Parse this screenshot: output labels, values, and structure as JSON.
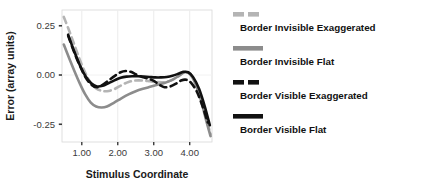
{
  "chart_data": {
    "type": "line",
    "title": "",
    "xlabel": "Stimulus Coordinate",
    "ylabel": "Error (array units)",
    "xlim": [
      0.45,
      4.62
    ],
    "ylim": [
      -0.34,
      0.33
    ],
    "xticks": [
      "1.00",
      "2.00",
      "3.00",
      "4.00"
    ],
    "xtick_values": [
      1.0,
      2.0,
      3.0,
      4.0
    ],
    "yticks": [
      "0.25",
      "0.00",
      "-0.25"
    ],
    "ytick_values": [
      0.25,
      0.0,
      -0.25
    ],
    "grid": "vertical-major-only",
    "legend_position": "right",
    "series": [
      {
        "name": "Border Invisible Exaggerated",
        "color": "#b4b4b4",
        "dash": "dashed",
        "x": [
          0.5,
          0.65,
          0.8,
          0.95,
          1.1,
          1.25,
          1.4,
          1.55,
          1.7,
          1.9,
          2.1,
          2.3,
          2.5,
          2.7,
          2.9,
          3.1,
          3.3,
          3.5,
          3.7,
          3.85,
          4.0,
          4.15,
          4.3,
          4.45,
          4.58
        ],
        "y": [
          0.295,
          0.225,
          0.15,
          0.075,
          0.01,
          -0.04,
          -0.068,
          -0.08,
          -0.082,
          -0.072,
          -0.052,
          -0.035,
          -0.028,
          -0.028,
          -0.032,
          -0.036,
          -0.036,
          -0.026,
          -0.004,
          0.012,
          0.008,
          -0.035,
          -0.11,
          -0.215,
          -0.3
        ]
      },
      {
        "name": "Border Invisible Flat",
        "color": "#8c8c8c",
        "dash": "solid",
        "x": [
          0.5,
          0.65,
          0.8,
          0.95,
          1.1,
          1.25,
          1.4,
          1.55,
          1.7,
          1.9,
          2.1,
          2.3,
          2.5,
          2.7,
          2.9,
          3.1,
          3.3,
          3.5,
          3.7,
          3.85,
          4.0,
          4.15,
          4.3,
          4.45,
          4.58
        ],
        "y": [
          0.155,
          0.085,
          0.018,
          -0.045,
          -0.1,
          -0.14,
          -0.16,
          -0.165,
          -0.16,
          -0.14,
          -0.118,
          -0.098,
          -0.082,
          -0.07,
          -0.06,
          -0.05,
          -0.04,
          -0.026,
          -0.004,
          0.014,
          0.006,
          -0.04,
          -0.12,
          -0.225,
          -0.31
        ]
      },
      {
        "name": "Border Visible Exaggerated",
        "color": "#111111",
        "dash": "dashed",
        "x": [
          0.62,
          0.78,
          0.94,
          1.1,
          1.26,
          1.42,
          1.58,
          1.74,
          1.92,
          2.08,
          2.22,
          2.36,
          2.52,
          2.68,
          2.84,
          3.0,
          3.16,
          3.3,
          3.46,
          3.62,
          3.76,
          3.9,
          4.04,
          4.2,
          4.36,
          4.5
        ],
        "y": [
          0.2,
          0.12,
          0.05,
          -0.01,
          -0.048,
          -0.062,
          -0.05,
          -0.028,
          -0.004,
          0.014,
          0.02,
          0.016,
          0.002,
          -0.01,
          -0.018,
          -0.03,
          -0.05,
          -0.062,
          -0.058,
          -0.044,
          -0.028,
          -0.024,
          -0.04,
          -0.085,
          -0.16,
          -0.24
        ]
      },
      {
        "name": "Border Visible Flat",
        "color": "#111111",
        "dash": "solid",
        "x": [
          0.62,
          0.78,
          0.94,
          1.1,
          1.26,
          1.42,
          1.58,
          1.74,
          1.92,
          2.08,
          2.24,
          2.4,
          2.56,
          2.72,
          2.88,
          3.04,
          3.2,
          3.36,
          3.52,
          3.68,
          3.82,
          3.96,
          4.1,
          4.26,
          4.42,
          4.56
        ],
        "y": [
          0.205,
          0.125,
          0.052,
          -0.005,
          -0.042,
          -0.058,
          -0.055,
          -0.042,
          -0.026,
          -0.014,
          -0.008,
          -0.006,
          -0.006,
          -0.008,
          -0.01,
          -0.012,
          -0.012,
          -0.01,
          -0.004,
          0.006,
          0.016,
          0.014,
          -0.012,
          -0.07,
          -0.16,
          -0.255
        ]
      }
    ]
  },
  "legend": {
    "entries": [
      {
        "label": "Border Invisible Exaggerated",
        "color": "#b4b4b4",
        "dash": "dashed"
      },
      {
        "label": "Border Invisible Flat",
        "color": "#8c8c8c",
        "dash": "solid"
      },
      {
        "label": "Border Visible Exaggerated",
        "color": "#111111",
        "dash": "dashed"
      },
      {
        "label": "Border Visible Flat",
        "color": "#111111",
        "dash": "solid"
      }
    ]
  },
  "colors": {
    "panel_background": "#ffffff",
    "panel_border": "#d8d8d8",
    "gridline": "#ededed",
    "text": "#1a1a1a",
    "tick": "#3a3a3a"
  }
}
